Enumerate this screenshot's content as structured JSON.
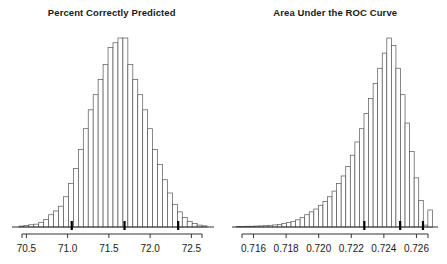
{
  "figure": {
    "background": "#ffffff",
    "axis_color": "#333333",
    "bar_outline": "#555555",
    "bar_fill": "#ffffff",
    "marker_color": "#000000",
    "text_color": "#1a1a1a",
    "width": 447,
    "height": 264
  },
  "panels": [
    {
      "id": "percent-correctly-predicted",
      "title": "Percent Correctly Predicted",
      "axis_ticks": [
        "70.5",
        "71.0",
        "71.5",
        "72.0",
        "72.5"
      ],
      "markers": [
        "71.05",
        "71.69",
        "72.34"
      ]
    },
    {
      "id": "area-under-the-roc-curve",
      "title": "Area Under the ROC Curve",
      "axis_ticks": [
        "0.716",
        "0.718",
        "0.720",
        "0.722",
        "0.724",
        "0.726"
      ],
      "markers": [
        "0.7228",
        "0.7250",
        "0.7264"
      ]
    }
  ],
  "chart_data": [
    {
      "type": "bar",
      "title": "Percent Correctly Predicted",
      "subtitle": "",
      "xlabel": "",
      "ylabel": "",
      "orientation": "vertical",
      "grid": false,
      "legend": null,
      "xlim": [
        70.35,
        72.75
      ],
      "ylim": [
        0,
        100
      ],
      "tick_values": [
        70.5,
        71.0,
        71.5,
        72.0,
        72.5
      ],
      "tick_labels": [
        "70.5",
        "71.0",
        "71.5",
        "72.0",
        "72.5"
      ],
      "bin_width": 0.06,
      "annotations": [
        {
          "label": "lower bound marker",
          "x": 71.05
        },
        {
          "label": "point estimate marker",
          "x": 71.69
        },
        {
          "label": "upper bound marker",
          "x": 72.34
        }
      ],
      "x": [
        70.44,
        70.5,
        70.56,
        70.62,
        70.68,
        70.74,
        70.8,
        70.86,
        70.92,
        70.98,
        71.04,
        71.1,
        71.16,
        71.22,
        71.28,
        71.34,
        71.4,
        71.46,
        71.52,
        71.58,
        71.64,
        71.7,
        71.76,
        71.82,
        71.88,
        71.94,
        72.0,
        72.06,
        72.12,
        72.18,
        72.24,
        72.3,
        72.36,
        72.42,
        72.48,
        72.54,
        72.6,
        72.66
      ],
      "values": [
        0.5,
        0.8,
        1.2,
        1.5,
        2.5,
        4.0,
        6.5,
        8.5,
        11.0,
        16.0,
        23.0,
        31.0,
        41.0,
        52.0,
        62.0,
        70.0,
        78.0,
        86.0,
        95.0,
        97.5,
        100.0,
        100.0,
        86.0,
        78.0,
        70.0,
        62.0,
        52.0,
        41.0,
        33.0,
        25.0,
        18.0,
        12.0,
        8.0,
        5.0,
        3.0,
        1.8,
        1.0,
        0.6
      ]
    },
    {
      "type": "bar",
      "title": "Area Under the ROC Curve",
      "subtitle": "",
      "xlabel": "",
      "ylabel": "",
      "orientation": "vertical",
      "grid": false,
      "legend": null,
      "xlim": [
        0.7148,
        0.7272
      ],
      "ylim": [
        0,
        100
      ],
      "tick_values": [
        0.716,
        0.718,
        0.72,
        0.722,
        0.724,
        0.726
      ],
      "tick_labels": [
        "0.716",
        "0.718",
        "0.720",
        "0.722",
        "0.724",
        "0.726"
      ],
      "bin_width": 0.00028,
      "annotations": [
        {
          "label": "lower bound marker",
          "x": 0.7228
        },
        {
          "label": "point estimate marker",
          "x": 0.725
        },
        {
          "label": "upper bound marker",
          "x": 0.7264
        }
      ],
      "x": [
        0.71508,
        0.71536,
        0.71564,
        0.71592,
        0.7162,
        0.71648,
        0.71676,
        0.71704,
        0.71732,
        0.7176,
        0.71788,
        0.71816,
        0.71844,
        0.71872,
        0.719,
        0.71928,
        0.71956,
        0.71984,
        0.72012,
        0.7204,
        0.72068,
        0.72096,
        0.72124,
        0.72152,
        0.7218,
        0.72208,
        0.72236,
        0.72264,
        0.72292,
        0.7232,
        0.72348,
        0.72376,
        0.72404,
        0.72432,
        0.7246,
        0.72488,
        0.72516,
        0.72544,
        0.72572,
        0.726,
        0.72628,
        0.72656,
        0.72684
      ],
      "values": [
        0.3,
        0.3,
        0.4,
        0.4,
        0.5,
        0.6,
        0.7,
        0.9,
        1.1,
        1.4,
        1.8,
        2.3,
        3.0,
        3.8,
        5.0,
        6.5,
        8.0,
        9.5,
        11.5,
        13.5,
        16.0,
        19.0,
        23.0,
        27.0,
        32.0,
        38.0,
        45.0,
        52.0,
        60.0,
        68.0,
        76.0,
        84.0,
        92.0,
        100.0,
        96.0,
        84.0,
        70.0,
        55.0,
        40.0,
        26.0,
        14.0,
        1.0,
        9.0
      ]
    }
  ],
  "caption": {
    "partial_text": ""
  }
}
